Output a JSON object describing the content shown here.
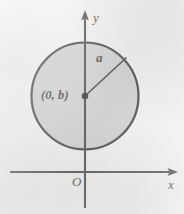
{
  "figure": {
    "type": "geometry-diagram",
    "canvas": {
      "width": 184,
      "height": 214
    },
    "colors": {
      "background": "#f1f1f0",
      "circle_fill": "#c9c9c9",
      "stroke": "#1d1d1d",
      "label_text": "#1d1d1d"
    },
    "axes": {
      "y_axis": {
        "label": "y",
        "orientation": "vertical",
        "x_position": 85,
        "from_y": 208,
        "to_y": 13,
        "arrowhead": "up",
        "label_x": 93,
        "label_y": 11
      },
      "x_axis": {
        "label": "x",
        "orientation": "horizontal",
        "y_position": 172,
        "from_x": 10,
        "to_x": 176,
        "arrowhead": "right",
        "label_x": 168,
        "label_y": 178
      },
      "origin": {
        "label": "O",
        "x": 85,
        "y": 172,
        "label_x": 72,
        "label_y": 175
      }
    },
    "circle": {
      "center_label": "(0, b)",
      "center_x": 85,
      "center_y": 96,
      "radius": 54,
      "fill": "#c9c9c9",
      "stroke": "#1d1d1d",
      "stroke_width": 2.2,
      "center_dot_radius": 3.2
    },
    "radius_segment": {
      "label": "a",
      "from_x": 85,
      "from_y": 96,
      "to_x": 127,
      "to_y": 57,
      "stroke_width": 1.6,
      "label_x": 96,
      "label_y": 51
    }
  }
}
